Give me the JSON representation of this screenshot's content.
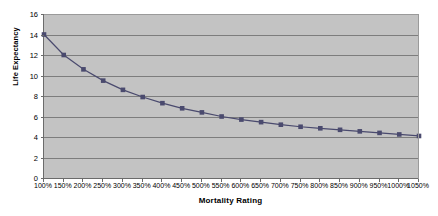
{
  "chart_data": {
    "type": "line",
    "title": "",
    "xlabel": "Mortality Rating",
    "ylabel": "Life Expectancy",
    "categories": [
      "100%",
      "150%",
      "200%",
      "250%",
      "300%",
      "350%",
      "400%",
      "450%",
      "500%",
      "550%",
      "600%",
      "650%",
      "700%",
      "750%",
      "800%",
      "850%",
      "900%",
      "950%",
      "1000%",
      "1050%"
    ],
    "values": [
      14.0,
      12.0,
      10.6,
      9.5,
      8.6,
      7.9,
      7.3,
      6.8,
      6.4,
      6.0,
      5.7,
      5.45,
      5.2,
      5.0,
      4.85,
      4.7,
      4.55,
      4.4,
      4.25,
      4.1
    ],
    "series": [
      {
        "name": "Life Expectancy",
        "values": [
          14.0,
          12.0,
          10.6,
          9.5,
          8.6,
          7.9,
          7.3,
          6.8,
          6.4,
          6.0,
          5.7,
          5.45,
          5.2,
          5.0,
          4.85,
          4.7,
          4.55,
          4.4,
          4.25,
          4.1
        ],
        "color": "#4a4a6e",
        "marker": "square"
      }
    ],
    "ylim": [
      0,
      16
    ],
    "yticks": [
      0,
      2,
      4,
      6,
      8,
      10,
      12,
      14,
      16
    ],
    "ytick_labels": [
      "0",
      "2",
      "4",
      "6",
      "8",
      "10",
      "12",
      "14",
      "16"
    ],
    "grid": true,
    "grid_axis": "y",
    "legend": false,
    "plot_background": "#c3c3c3",
    "page_background": "#ffffff",
    "axis_color": "#6b6b6b",
    "gridline_color": "#7d7d7d"
  }
}
